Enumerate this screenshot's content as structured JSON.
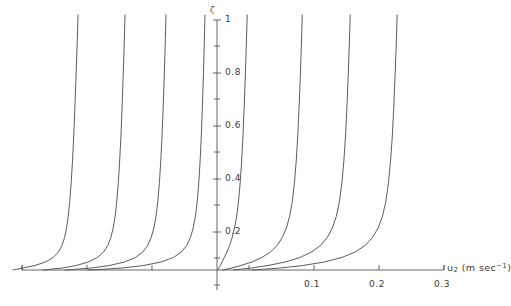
{
  "figure": {
    "background_color": "#ffffff",
    "line_color": "#4a4a4a",
    "axis_color": "#555555",
    "text_color": "#3b3b3b"
  },
  "axes": {
    "y_axis_symbol": "ζ",
    "x_axis_title_main": "u",
    "x_axis_title_sub": "2",
    "x_axis_title_unit_open": " (m sec",
    "x_axis_title_unit_sup": "−1",
    "x_axis_title_unit_close": ")"
  },
  "chart_data": {
    "type": "line",
    "title": "",
    "xlabel": "u2 (m sec^-1)",
    "ylabel": "ζ",
    "grid": false,
    "legend": "none",
    "xlim": [
      -0.3,
      0.31
    ],
    "ylim": [
      0,
      1.05
    ],
    "x_ticks_labeled": [
      {
        "value": 0.1,
        "label": "0.1",
        "px": 314
      },
      {
        "value": 0.2,
        "label": "0.2",
        "px": 379
      },
      {
        "value": 0.3,
        "label": "0.3",
        "px": 444
      }
    ],
    "x_ticks_unlabeled": [
      {
        "value": -0.3,
        "px": 22
      },
      {
        "value": -0.2,
        "px": 87
      },
      {
        "value": -0.1,
        "px": 152
      },
      {
        "value": 0.0,
        "px": 217
      },
      {
        "value": 0.05,
        "px": 249
      }
    ],
    "y_ticks_major": [
      {
        "value": 1.0,
        "label": "1",
        "px": 20
      },
      {
        "value": 0.8,
        "label": "0.8",
        "px": 73
      },
      {
        "value": 0.6,
        "label": "0.6",
        "px": 126
      },
      {
        "value": 0.4,
        "label": "0.4",
        "px": 179
      },
      {
        "value": 0.2,
        "label": "0.2",
        "px": 232
      }
    ],
    "y_ticks_minor": [
      {
        "value": 0.9,
        "px": 46
      },
      {
        "value": 0.7,
        "px": 99
      },
      {
        "value": 0.5,
        "px": 152
      },
      {
        "value": 0.3,
        "px": 205
      },
      {
        "value": 0.1,
        "px": 258
      }
    ],
    "axis_origin_px": {
      "x": 217,
      "y": 270
    },
    "x_scale_px_per_unit": 650,
    "series": [
      {
        "name": "curve-1",
        "top_x": -0.214,
        "bottom_x": -0.218,
        "direction": "left",
        "points": [
          [
            -0.2138,
            1.02
          ],
          [
            -0.2152,
            0.9
          ],
          [
            -0.2168,
            0.78
          ],
          [
            -0.2185,
            0.66
          ],
          [
            -0.2203,
            0.54
          ],
          [
            -0.2222,
            0.44
          ],
          [
            -0.2243,
            0.35
          ],
          [
            -0.2265,
            0.275
          ],
          [
            -0.2289,
            0.215
          ],
          [
            -0.2315,
            0.168
          ],
          [
            -0.2345,
            0.13
          ],
          [
            -0.2385,
            0.098
          ],
          [
            -0.244,
            0.072
          ],
          [
            -0.252,
            0.05
          ],
          [
            -0.264,
            0.032
          ],
          [
            -0.28,
            0.018
          ],
          [
            -0.2985,
            0.008
          ],
          [
            -0.308,
            0.003
          ],
          [
            -0.314,
            0.0
          ]
        ]
      },
      {
        "name": "curve-2",
        "top_x": -0.1415,
        "bottom_x": -0.146,
        "direction": "left",
        "points": [
          [
            -0.1415,
            1.02
          ],
          [
            -0.1428,
            0.9
          ],
          [
            -0.1443,
            0.78
          ],
          [
            -0.1459,
            0.66
          ],
          [
            -0.1477,
            0.54
          ],
          [
            -0.1497,
            0.44
          ],
          [
            -0.1518,
            0.35
          ],
          [
            -0.1541,
            0.275
          ],
          [
            -0.1567,
            0.215
          ],
          [
            -0.1597,
            0.168
          ],
          [
            -0.1633,
            0.13
          ],
          [
            -0.168,
            0.098
          ],
          [
            -0.1745,
            0.072
          ],
          [
            -0.184,
            0.05
          ],
          [
            -0.198,
            0.032
          ],
          [
            -0.2165,
            0.018
          ],
          [
            -0.238,
            0.008
          ],
          [
            -0.256,
            0.003
          ],
          [
            -0.268,
            0.0
          ]
        ]
      },
      {
        "name": "curve-3",
        "top_x": -0.0785,
        "bottom_x": -0.0835,
        "direction": "left",
        "points": [
          [
            -0.0785,
            1.02
          ],
          [
            -0.0797,
            0.9
          ],
          [
            -0.0811,
            0.78
          ],
          [
            -0.0827,
            0.66
          ],
          [
            -0.0845,
            0.54
          ],
          [
            -0.0864,
            0.44
          ],
          [
            -0.0886,
            0.35
          ],
          [
            -0.091,
            0.275
          ],
          [
            -0.0938,
            0.215
          ],
          [
            -0.0971,
            0.168
          ],
          [
            -0.1012,
            0.13
          ],
          [
            -0.1066,
            0.098
          ],
          [
            -0.1142,
            0.072
          ],
          [
            -0.1255,
            0.05
          ],
          [
            -0.1425,
            0.032
          ],
          [
            -0.1655,
            0.018
          ],
          [
            -0.193,
            0.008
          ],
          [
            -0.217,
            0.003
          ],
          [
            -0.234,
            0.0
          ]
        ]
      },
      {
        "name": "curve-4",
        "top_x": -0.0185,
        "bottom_x": -0.0255,
        "direction": "left",
        "points": [
          [
            -0.0185,
            1.02
          ],
          [
            -0.0196,
            0.9
          ],
          [
            -0.0209,
            0.78
          ],
          [
            -0.0224,
            0.66
          ],
          [
            -0.0241,
            0.54
          ],
          [
            -0.0259,
            0.44
          ],
          [
            -0.028,
            0.35
          ],
          [
            -0.0304,
            0.275
          ],
          [
            -0.0332,
            0.215
          ],
          [
            -0.0366,
            0.168
          ],
          [
            -0.0409,
            0.13
          ],
          [
            -0.0466,
            0.098
          ],
          [
            -0.0548,
            0.072
          ],
          [
            -0.0672,
            0.05
          ],
          [
            -0.0862,
            0.032
          ],
          [
            -0.113,
            0.018
          ],
          [
            -0.146,
            0.008
          ],
          [
            -0.176,
            0.003
          ],
          [
            -0.198,
            0.0
          ]
        ]
      },
      {
        "name": "curve-5",
        "top_x": 0.0465,
        "bottom_x": 0.0075,
        "direction": "right",
        "points": [
          [
            0.0465,
            1.02
          ],
          [
            0.0451,
            0.9
          ],
          [
            0.0436,
            0.78
          ],
          [
            0.0419,
            0.66
          ],
          [
            0.04,
            0.54
          ],
          [
            0.038,
            0.44
          ],
          [
            0.0357,
            0.35
          ],
          [
            0.0331,
            0.275
          ],
          [
            0.0303,
            0.215
          ],
          [
            0.027,
            0.168
          ],
          [
            0.0234,
            0.13
          ],
          [
            0.0194,
            0.098
          ],
          [
            0.0152,
            0.072
          ],
          [
            0.0112,
            0.05
          ],
          [
            0.0077,
            0.032
          ],
          [
            0.005,
            0.018
          ],
          [
            0.0029,
            0.008
          ],
          [
            0.0016,
            0.003
          ],
          [
            0.0008,
            0.0
          ]
        ]
      },
      {
        "name": "curve-6",
        "top_x": 0.1312,
        "bottom_x": 0.04,
        "direction": "right",
        "points": [
          [
            0.1312,
            1.02
          ],
          [
            0.1298,
            0.9
          ],
          [
            0.1282,
            0.78
          ],
          [
            0.1264,
            0.66
          ],
          [
            0.1243,
            0.54
          ],
          [
            0.122,
            0.44
          ],
          [
            0.1192,
            0.35
          ],
          [
            0.1159,
            0.275
          ],
          [
            0.1118,
            0.215
          ],
          [
            0.1068,
            0.168
          ],
          [
            0.1005,
            0.13
          ],
          [
            0.0925,
            0.098
          ],
          [
            0.0822,
            0.072
          ],
          [
            0.0692,
            0.05
          ],
          [
            0.0535,
            0.032
          ],
          [
            0.0368,
            0.018
          ],
          [
            0.0225,
            0.008
          ],
          [
            0.014,
            0.003
          ],
          [
            0.009,
            0.0
          ]
        ]
      },
      {
        "name": "curve-7",
        "top_x": 0.205,
        "bottom_x": 0.072,
        "direction": "right",
        "points": [
          [
            0.205,
            1.02
          ],
          [
            0.2035,
            0.9
          ],
          [
            0.2019,
            0.78
          ],
          [
            0.2,
            0.66
          ],
          [
            0.1978,
            0.54
          ],
          [
            0.1953,
            0.44
          ],
          [
            0.1922,
            0.35
          ],
          [
            0.1884,
            0.275
          ],
          [
            0.1836,
            0.215
          ],
          [
            0.1775,
            0.168
          ],
          [
            0.1696,
            0.13
          ],
          [
            0.1592,
            0.098
          ],
          [
            0.1455,
            0.072
          ],
          [
            0.1275,
            0.05
          ],
          [
            0.1048,
            0.032
          ],
          [
            0.0785,
            0.018
          ],
          [
            0.053,
            0.008
          ],
          [
            0.036,
            0.003
          ],
          [
            0.025,
            0.0
          ]
        ]
      },
      {
        "name": "curve-8",
        "top_x": 0.2772,
        "bottom_x": 0.105,
        "direction": "right",
        "points": [
          [
            0.2772,
            1.02
          ],
          [
            0.2757,
            0.9
          ],
          [
            0.274,
            0.78
          ],
          [
            0.2721,
            0.66
          ],
          [
            0.2698,
            0.54
          ],
          [
            0.2671,
            0.44
          ],
          [
            0.2639,
            0.35
          ],
          [
            0.2598,
            0.275
          ],
          [
            0.2546,
            0.215
          ],
          [
            0.2479,
            0.168
          ],
          [
            0.2392,
            0.13
          ],
          [
            0.2278,
            0.098
          ],
          [
            0.2125,
            0.072
          ],
          [
            0.192,
            0.05
          ],
          [
            0.165,
            0.032
          ],
          [
            0.132,
            0.018
          ],
          [
            0.0975,
            0.008
          ],
          [
            0.072,
            0.003
          ],
          [
            0.054,
            0.0
          ]
        ]
      }
    ]
  }
}
